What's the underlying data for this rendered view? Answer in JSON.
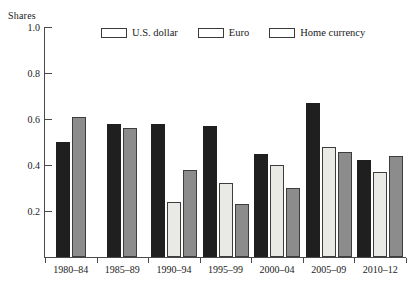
{
  "chart_data": {
    "type": "bar",
    "title": "",
    "subtitle": "",
    "xlabel": "",
    "ylabel": "Shares",
    "ylim": [
      0,
      1.0
    ],
    "yticks": [
      "0.2",
      "0.4",
      "0.6",
      "0.8",
      "1.0"
    ],
    "ytick_values": [
      0.2,
      0.4,
      0.6,
      0.8,
      1.0
    ],
    "grid": false,
    "legend_position": "top-center",
    "categories": [
      "1980–84",
      "1985–89",
      "1990–94",
      "1995–99",
      "2000–04",
      "2005–09",
      "2010–12"
    ],
    "series": [
      {
        "name": "U.S. dollar",
        "color": "#1f1f1f",
        "values": [
          0.5,
          0.58,
          0.58,
          0.57,
          0.45,
          0.67,
          0.42
        ]
      },
      {
        "name": "Euro",
        "color": "#e9e9e6",
        "values": [
          null,
          null,
          0.24,
          0.32,
          0.4,
          0.48,
          0.37
        ]
      },
      {
        "name": "Home currency",
        "color": "#8c8c8c",
        "values": [
          0.61,
          0.56,
          0.38,
          0.23,
          0.3,
          0.455,
          0.44
        ]
      }
    ]
  },
  "axis": {
    "y_title": "Shares"
  },
  "legend": {
    "items": [
      {
        "label": "U.S. dollar",
        "swatch": "usd"
      },
      {
        "label": "Euro",
        "swatch": "eur"
      },
      {
        "label": "Home currency",
        "swatch": "home"
      }
    ]
  }
}
